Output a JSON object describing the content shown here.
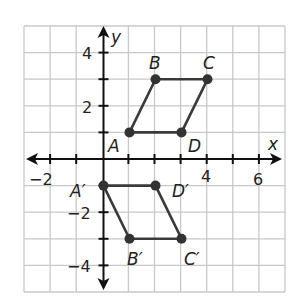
{
  "plane": {
    "x_axis_label": "x",
    "y_axis_label": "y",
    "x_range": [
      -3,
      7
    ],
    "y_range": [
      -5,
      5
    ],
    "x_tick_labels": [
      {
        "value": -2,
        "text": "−2"
      },
      {
        "value": 4,
        "text": "4"
      },
      {
        "value": 6,
        "text": "6"
      }
    ],
    "y_tick_labels": [
      {
        "value": 4,
        "text": "4"
      },
      {
        "value": 2,
        "text": "2"
      },
      {
        "value": -2,
        "text": "−2"
      },
      {
        "value": -4,
        "text": "−4"
      }
    ],
    "colors": {
      "grid": "#c8c8c8",
      "axis": "#111111",
      "figure": "#3a3a3a",
      "point": "#333333"
    }
  },
  "figures": [
    {
      "name": "ABCD",
      "vertices": [
        {
          "label": "A",
          "x": 1,
          "y": 1
        },
        {
          "label": "B",
          "x": 2,
          "y": 3
        },
        {
          "label": "C",
          "x": 4,
          "y": 3
        },
        {
          "label": "D",
          "x": 3,
          "y": 1
        }
      ]
    },
    {
      "name": "A'B'C'D'",
      "vertices": [
        {
          "label": "A′",
          "x": 0,
          "y": -1
        },
        {
          "label": "B′",
          "x": 1,
          "y": -3
        },
        {
          "label": "C′",
          "x": 3,
          "y": -3
        },
        {
          "label": "D′",
          "x": 2,
          "y": -1
        }
      ]
    }
  ],
  "labels": {
    "A": "A",
    "B": "B",
    "C": "C",
    "D": "D",
    "A_prime": "A′",
    "B_prime": "B′",
    "C_prime": "C′",
    "D_prime": "D′"
  }
}
